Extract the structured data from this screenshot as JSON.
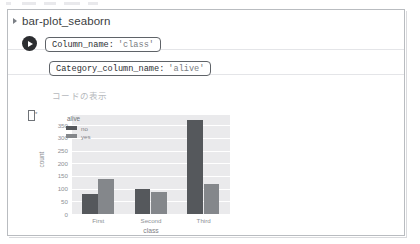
{
  "window": {
    "title": "bar-plot_seaborn",
    "expand_icon": "triangle-right-icon"
  },
  "cell": {
    "run_icon": "play-icon",
    "output_icon": "output-bracket-icon",
    "show_code_label": "コードの表示",
    "params": [
      {
        "key": "Column_name:",
        "value": "'class'"
      },
      {
        "key": "Category_column_name:",
        "value": "'alive'"
      }
    ]
  },
  "colors": {
    "bar_no": "#55585c",
    "bar_yes": "#84878b",
    "plot_bg": "#eaeaec",
    "grid": "#ffffff",
    "tick_text": "#8d9095"
  },
  "chart_data": {
    "type": "bar",
    "title": "",
    "subtitle": "",
    "xlabel": "class",
    "ylabel": "count",
    "categories": [
      "First",
      "Second",
      "Third"
    ],
    "series": [
      {
        "name": "no",
        "values": [
          80,
          97,
          372
        ],
        "color": "#55585c"
      },
      {
        "name": "yes",
        "values": [
          136,
          87,
          119
        ],
        "color": "#84878b"
      }
    ],
    "legend": {
      "title": "alive",
      "entries": [
        "no",
        "yes"
      ],
      "position": "upper-left-inside"
    },
    "ylim": [
      0,
      390
    ],
    "yticks": [
      0,
      50,
      100,
      150,
      200,
      250,
      300,
      350
    ],
    "ytick_labels": [
      "0",
      "50",
      "100",
      "150",
      "200",
      "250",
      "300",
      "350"
    ],
    "grid": true,
    "grid_axis": "y"
  }
}
